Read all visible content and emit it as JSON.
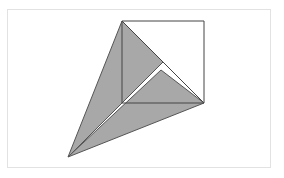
{
  "figure": {
    "canvas": {
      "width": 284,
      "height": 178,
      "background": "#ffffff"
    },
    "frame": {
      "name": "image-border",
      "x": 7,
      "y": 9,
      "width": 264,
      "height": 159,
      "stroke": "#e2e2e2",
      "stroke_width": 1,
      "fill": "#ffffff"
    },
    "palette": {
      "shape_fill": "#a8a8a8",
      "shape_stroke": "#555555",
      "outline_stroke": "#444444",
      "background": "#ffffff",
      "frame_stroke": "#e2e2e2"
    },
    "points": {
      "square_top_left": {
        "label": "A",
        "x": 122,
        "y": 21
      },
      "square_top_right": {
        "label": "B",
        "x": 204,
        "y": 21
      },
      "square_bottom_right": {
        "label": "C",
        "x": 204,
        "y": 103
      },
      "square_bottom_left": {
        "label": "D",
        "x": 122,
        "y": 103
      },
      "apex": {
        "label": "E",
        "x": 68,
        "y": 157
      },
      "upper_triangle_right": {
        "label": "F",
        "x": 163,
        "y": 62
      },
      "lower_triangle_top": {
        "label": "G",
        "x": 161,
        "y": 70
      }
    },
    "shapes": [
      {
        "name": "square-outline",
        "type": "polygon",
        "points": "122,21 204,21 204,103 122,103",
        "fill": "none",
        "stroke": "#444444",
        "stroke_width": 1
      },
      {
        "name": "square-diagonal",
        "type": "line",
        "x1": 122,
        "y1": 21,
        "x2": 204,
        "y2": 103,
        "stroke": "#444444",
        "stroke_width": 1
      },
      {
        "name": "upper-shaded-triangle",
        "type": "polygon",
        "points": "122,21 163,62 68,157",
        "fill": "#a8a8a8",
        "stroke": "#555555",
        "stroke_width": 1
      },
      {
        "name": "lower-shaded-triangle",
        "type": "polygon",
        "points": "161,70 204,103 68,157",
        "fill": "#a8a8a8",
        "stroke": "#555555",
        "stroke_width": 1
      }
    ]
  }
}
